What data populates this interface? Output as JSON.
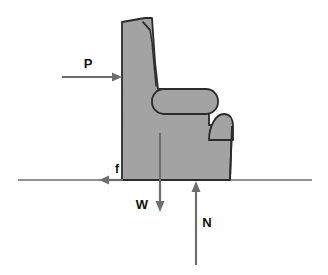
{
  "figure": {
    "background_color": "#ffffff",
    "body_fill_color": "#a3a3a3",
    "body_stroke_color": "#2b2b2b",
    "arrow_color": "#6e6e6e",
    "ground_line_color": "#6e6e6e",
    "label_color": "#111111"
  },
  "ground": {
    "name": "ground-line",
    "x_start": 18,
    "x_end": 312,
    "y": 180
  },
  "chair": {
    "name": "chair-body",
    "back_top_y": 18,
    "base_y": 180,
    "back_left_x": 120,
    "front_right_x": 228,
    "seam_label": "back-cushion-seam",
    "armrest": {
      "name": "armrest",
      "x": 152,
      "y": 89,
      "width": 66,
      "height": 25,
      "corner_radius": 12
    },
    "front_bump": {
      "name": "armrest-front-end",
      "x": 209,
      "y": 114,
      "width": 23,
      "height": 26,
      "corner_radius": 11
    }
  },
  "forces": [
    {
      "symbol": "P",
      "name": "applied-force-p",
      "direction": "right",
      "label_x": 88,
      "label_y": 68,
      "shaft": {
        "x1": 62,
        "y1": 77,
        "x2": 122,
        "y2": 77
      },
      "description": "Applied horizontal push on chair back"
    },
    {
      "symbol": "f",
      "name": "friction-force-f",
      "direction": "left",
      "label_x": 117,
      "label_y": 172,
      "shaft": {
        "x1": 123,
        "y1": 180,
        "x2": 99,
        "y2": 180
      },
      "description": "Friction force at the ground"
    },
    {
      "symbol": "W",
      "name": "weight-force-w",
      "direction": "down",
      "label_x": 142,
      "label_y": 208,
      "shaft": {
        "x1": 160,
        "y1": 133,
        "x2": 160,
        "y2": 212
      },
      "description": "Weight acting downward through center of mass"
    },
    {
      "symbol": "N",
      "name": "normal-force-n",
      "direction": "up",
      "label_x": 206,
      "label_y": 226,
      "shaft": {
        "x1": 196,
        "y1": 265,
        "x2": 196,
        "y2": 181
      },
      "description": "Normal reaction force from the ground"
    }
  ]
}
